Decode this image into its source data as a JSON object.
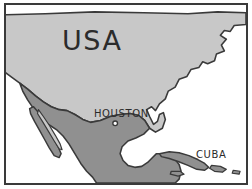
{
  "figure": {
    "kind": "map",
    "region": "North America and Caribbean",
    "style": "hand-drawn sketch, grayscale",
    "border_color": "#3a3a3a",
    "background_color": "#ffffff"
  },
  "colors": {
    "usa_fill": "#c8c8c8",
    "mexico_fill": "#909090",
    "cuba_fill": "#909090",
    "ocean_fill": "#ffffff",
    "coastline_stroke": "#3a3a3a",
    "text": "#2b2b2b",
    "frame": "#3a3a3a"
  },
  "labels": {
    "usa": "USA",
    "houston": "HOUSTON",
    "cuba": "CUBA"
  },
  "markers": [
    {
      "name": "houston-marker",
      "label": "HOUSTON",
      "x": 115,
      "y": 124,
      "shape": "open-circle"
    }
  ],
  "regions": [
    {
      "name": "united-states",
      "label": "USA",
      "fill": "#c8c8c8",
      "shade": "light-gray"
    },
    {
      "name": "mexico",
      "label": "",
      "fill": "#909090",
      "shade": "medium-gray"
    },
    {
      "name": "cuba",
      "label": "CUBA",
      "fill": "#909090",
      "shade": "medium-gray"
    },
    {
      "name": "caribbean-islands",
      "label": "",
      "fill": "#909090",
      "shade": "medium-gray"
    }
  ]
}
